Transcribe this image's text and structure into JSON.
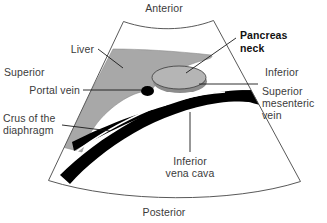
{
  "figure": {
    "type": "ultrasound-sector-diagram",
    "background_color": "#ffffff",
    "outline_color": "#595959",
    "text_color": "#3b3b3b",
    "bold_text_color": "#111111"
  },
  "orientation_labels": {
    "anterior": "Anterior",
    "posterior": "Posterior",
    "superior": "Superior",
    "inferior": "Inferior"
  },
  "structure_labels": {
    "liver": "Liver",
    "portal_vein": "Portal vein",
    "crus_line1": "Crus of the",
    "crus_line2": "diaphragm",
    "pancreas_line1": "Pancreas",
    "pancreas_line2": "neck",
    "smv_line1": "Superior",
    "smv_line2": "mesenteric",
    "smv_line3": "vein",
    "ivc_line1": "Inferior",
    "ivc_line2": "vena cava"
  },
  "structures": [
    {
      "name": "liver",
      "label": "Liver",
      "fill": "#a8a8a8",
      "shape": "wedge"
    },
    {
      "name": "pancreas-neck",
      "label": "Pancreas neck",
      "fill": "#b0b0b0",
      "shape": "ellipse",
      "emphasis": "bold"
    },
    {
      "name": "portal-vein",
      "label": "Portal vein",
      "fill": "#000000",
      "shape": "small-ellipse"
    },
    {
      "name": "inferior-vena-cava",
      "label": "Inferior vena cava",
      "fill": "#000000",
      "shape": "band"
    },
    {
      "name": "superior-mesenteric-vein",
      "label": "Superior mesenteric vein",
      "fill": "#000000",
      "shape": "wedge-tip"
    },
    {
      "name": "crus-of-the-diaphragm",
      "label": "Crus of the diaphragm",
      "fill": "#000000",
      "shape": "thin-sliver"
    }
  ],
  "colors": {
    "liver_gray": "#a8a8a8",
    "pancreas_gray": "#b0b0b0",
    "pancreas_shadow": "#8c8c8c",
    "vessel_black": "#000000",
    "outline": "#595959",
    "leader_line": "#1a1a1a"
  }
}
